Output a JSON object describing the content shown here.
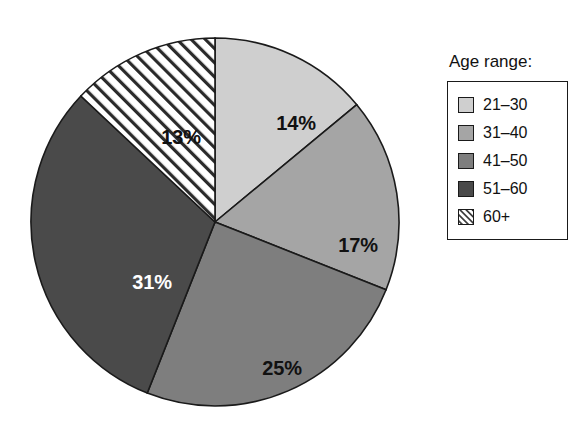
{
  "chart_data": {
    "type": "pie",
    "title": "",
    "legend_title": "Age range:",
    "legend_position": "right",
    "grid": false,
    "start_angle_deg": 0,
    "direction": "clockwise",
    "categories": [
      "21–30",
      "31–40",
      "41–50",
      "51–60",
      "60+"
    ],
    "values": [
      14,
      17,
      25,
      31,
      13
    ],
    "value_unit": "%",
    "data_labels": [
      "14%",
      "17%",
      "25%",
      "31%",
      "13%"
    ],
    "slices": [
      {
        "label": "21–30",
        "value": 14,
        "data_label": "14%",
        "fill": "#cfcfcf",
        "pattern": "solid",
        "label_color": "#111111",
        "label_x": 268,
        "label_y": 96
      },
      {
        "label": "31–40",
        "value": 17,
        "data_label": "17%",
        "fill": "#a5a5a5",
        "pattern": "solid",
        "label_color": "#111111",
        "label_x": 330,
        "label_y": 218
      },
      {
        "label": "41–50",
        "value": 25,
        "data_label": "25%",
        "fill": "#7e7e7e",
        "pattern": "solid",
        "label_color": "#111111",
        "label_x": 254,
        "label_y": 341
      },
      {
        "label": "51–60",
        "value": 31,
        "data_label": "31%",
        "fill": "#4a4a4a",
        "pattern": "solid",
        "label_color": "#ffffff",
        "label_x": 124,
        "label_y": 255
      },
      {
        "label": "60+",
        "value": 13,
        "data_label": "13%",
        "fill": "#ffffff",
        "pattern": "diagonal-hatch",
        "label_color": "#111111",
        "label_x": 153,
        "label_y": 110
      }
    ],
    "geometry": {
      "center_x": 187,
      "center_y": 188,
      "radius": 184,
      "stroke": "#1a1a1a"
    }
  },
  "legend": {
    "title": "Age range:",
    "items": [
      {
        "label": "21–30",
        "swatch": "swatch-21-30",
        "fill": "#cfcfcf",
        "pattern": "solid"
      },
      {
        "label": "31–40",
        "swatch": "swatch-31-40",
        "fill": "#a5a5a5",
        "pattern": "solid"
      },
      {
        "label": "41–50",
        "swatch": "swatch-41-50",
        "fill": "#7e7e7e",
        "pattern": "solid"
      },
      {
        "label": "51–60",
        "swatch": "swatch-51-60",
        "fill": "#4a4a4a",
        "pattern": "solid"
      },
      {
        "label": "60+",
        "swatch": "swatch-60-plus",
        "fill": "#ffffff",
        "pattern": "diagonal-hatch"
      }
    ]
  },
  "colors": {
    "background": "#ffffff",
    "outline": "#1a1a1a",
    "text": "#111111",
    "text_inverse": "#ffffff"
  }
}
